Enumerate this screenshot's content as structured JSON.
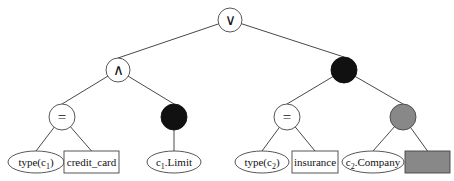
{
  "diagram": {
    "type": "expression-tree",
    "colors": {
      "line": "#333333",
      "black": "#111111",
      "gray": "#888888",
      "fill": "#ffffff"
    },
    "nodes": [
      {
        "id": "root",
        "label": "∨",
        "shape": "circle",
        "style": "white",
        "cx": 230,
        "cy": 20,
        "r": 12
      },
      {
        "id": "and",
        "label": "∧",
        "shape": "circle",
        "style": "white",
        "cx": 118,
        "cy": 70,
        "r": 12
      },
      {
        "id": "black-right",
        "label": "",
        "shape": "circle",
        "style": "black",
        "cx": 344,
        "cy": 70,
        "r": 13
      },
      {
        "id": "eq-left",
        "label": "=",
        "shape": "circle",
        "style": "white",
        "cx": 62,
        "cy": 117,
        "r": 13
      },
      {
        "id": "black-left",
        "label": "",
        "shape": "circle",
        "style": "black",
        "cx": 174,
        "cy": 117,
        "r": 13
      },
      {
        "id": "eq-right",
        "label": "=",
        "shape": "circle",
        "style": "white",
        "cx": 287,
        "cy": 117,
        "r": 13
      },
      {
        "id": "gray-right",
        "label": "",
        "shape": "circle",
        "style": "gray",
        "cx": 403,
        "cy": 117,
        "r": 13
      }
    ],
    "leaves": [
      {
        "id": "type-c1",
        "text": "type(c",
        "sub": "1",
        "after": ")",
        "shape": "ellipse",
        "cx": 36,
        "cy": 162,
        "rx": 28,
        "ry": 11
      },
      {
        "id": "credit-card",
        "text": "credit_card",
        "shape": "rect",
        "x": 64,
        "y": 151,
        "w": 55,
        "h": 22
      },
      {
        "id": "c1-limit",
        "text": "c",
        "sub": "1",
        "after": ".Limit",
        "shape": "ellipse",
        "cx": 174,
        "cy": 162,
        "rx": 27,
        "ry": 11
      },
      {
        "id": "type-c2",
        "text": "type(c",
        "sub": "2",
        "after": ")",
        "shape": "ellipse",
        "cx": 262,
        "cy": 162,
        "rx": 27,
        "ry": 11
      },
      {
        "id": "insurance",
        "text": "insurance",
        "shape": "rect",
        "x": 292,
        "y": 151,
        "w": 46,
        "h": 22
      },
      {
        "id": "c2-company",
        "text": "c",
        "sub": "2",
        "after": ".Company",
        "shape": "ellipse",
        "cx": 373,
        "cy": 162,
        "rx": 31,
        "ry": 11
      },
      {
        "id": "gray-box",
        "text": "",
        "shape": "rect",
        "style": "gray",
        "x": 405,
        "y": 151,
        "w": 45,
        "h": 22
      }
    ],
    "edges": [
      {
        "from": "root",
        "to": "and"
      },
      {
        "from": "root",
        "to": "black-right"
      },
      {
        "from": "and",
        "to": "eq-left"
      },
      {
        "from": "and",
        "to": "black-left"
      },
      {
        "from": "black-right",
        "to": "eq-right"
      },
      {
        "from": "black-right",
        "to": "gray-right"
      },
      {
        "from": "eq-left",
        "to": "type-c1"
      },
      {
        "from": "eq-left",
        "to": "credit-card"
      },
      {
        "from": "black-left",
        "to": "c1-limit"
      },
      {
        "from": "eq-right",
        "to": "type-c2"
      },
      {
        "from": "eq-right",
        "to": "insurance"
      },
      {
        "from": "gray-right",
        "to": "c2-company"
      },
      {
        "from": "gray-right",
        "to": "gray-box"
      }
    ]
  }
}
